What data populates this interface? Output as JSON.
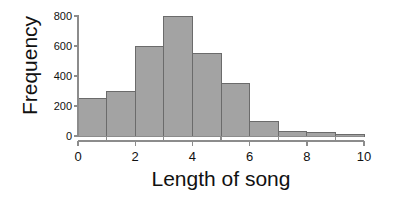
{
  "chart_data": {
    "type": "bar",
    "title": "",
    "subtitle": "",
    "xlabel": "Length of song",
    "ylabel": "Frequency",
    "categories": [
      "0-1",
      "1-2",
      "2-3",
      "3-4",
      "4-5",
      "5-6",
      "6-7",
      "7-8",
      "8-9",
      "9-10"
    ],
    "bin_edges": [
      0,
      1,
      2,
      3,
      4,
      5,
      6,
      7,
      8,
      9,
      10
    ],
    "bin_width": 1,
    "values": [
      250,
      300,
      600,
      800,
      550,
      350,
      100,
      30,
      25,
      10
    ],
    "xlim": [
      0,
      10
    ],
    "ylim": [
      0,
      800
    ],
    "xticks": [
      0,
      2,
      4,
      6,
      8,
      10
    ],
    "xtick_labels": [
      "0",
      "2",
      "4",
      "6",
      "8",
      "10"
    ],
    "xminor_ticks": [
      1,
      3,
      5,
      7,
      9
    ],
    "yticks": [
      0,
      200,
      400,
      600,
      800
    ],
    "ytick_labels": [
      "0",
      "200",
      "400",
      "600",
      "800"
    ],
    "grid": false,
    "legend": null,
    "legend_position": "none",
    "annotations": [],
    "colors": {
      "bar_fill": "#a3a3a3",
      "bar_stroke": "#6b6b6b",
      "axis": "#8c8c8c",
      "text": "#111111",
      "background": "#ffffff"
    }
  }
}
